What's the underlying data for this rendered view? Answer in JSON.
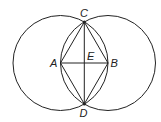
{
  "diagram": {
    "points": {
      "A": {
        "label": "A",
        "x": 60.5,
        "y": 63
      },
      "B": {
        "label": "B",
        "x": 108,
        "y": 63
      },
      "C": {
        "label": "C",
        "x": 84.3,
        "y": 22
      },
      "D": {
        "label": "D",
        "x": 84.3,
        "y": 104
      },
      "E": {
        "label": "E",
        "x": 84.3,
        "y": 63
      }
    },
    "circles": [
      {
        "center": "A",
        "radius": 47.5
      },
      {
        "center": "B",
        "radius": 47.5
      }
    ],
    "segments": [
      "AB",
      "CD",
      "AC",
      "CB",
      "BD",
      "DA"
    ],
    "stroke_color": "#222222"
  }
}
